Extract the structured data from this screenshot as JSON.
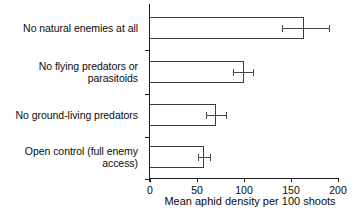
{
  "chart_data": {
    "type": "bar",
    "orientation": "horizontal",
    "title": "",
    "xlabel": "Mean aphid density per 100 shoots",
    "ylabel": "",
    "xlim": [
      0,
      200
    ],
    "xticks": [
      0,
      50,
      100,
      150,
      200
    ],
    "xtick_labels": [
      "0",
      "50",
      "100",
      "150",
      "200"
    ],
    "grid": false,
    "legend": "none",
    "bar_style": "unfilled-white-black-outline",
    "categories": [
      "No natural enemies at all",
      "No flying predators or parasitoids",
      "No ground-living predators",
      "Open control (full enemy access)"
    ],
    "values": [
      164,
      100,
      70,
      57
    ],
    "errors_low": [
      140,
      88,
      60,
      51
    ],
    "errors_high": [
      190,
      110,
      81,
      64
    ],
    "series": [
      {
        "name": "Mean aphid density",
        "values": [
          164,
          100,
          70,
          57
        ]
      }
    ]
  },
  "axis": {
    "x_title": "Mean aphid density per 100 shoots"
  },
  "categories_multiline": [
    [
      "No natural enemies at all"
    ],
    [
      "No flying predators or",
      "parasitoids"
    ],
    [
      "No ground-living predators"
    ],
    [
      "Open control (full enemy",
      "access)"
    ]
  ]
}
